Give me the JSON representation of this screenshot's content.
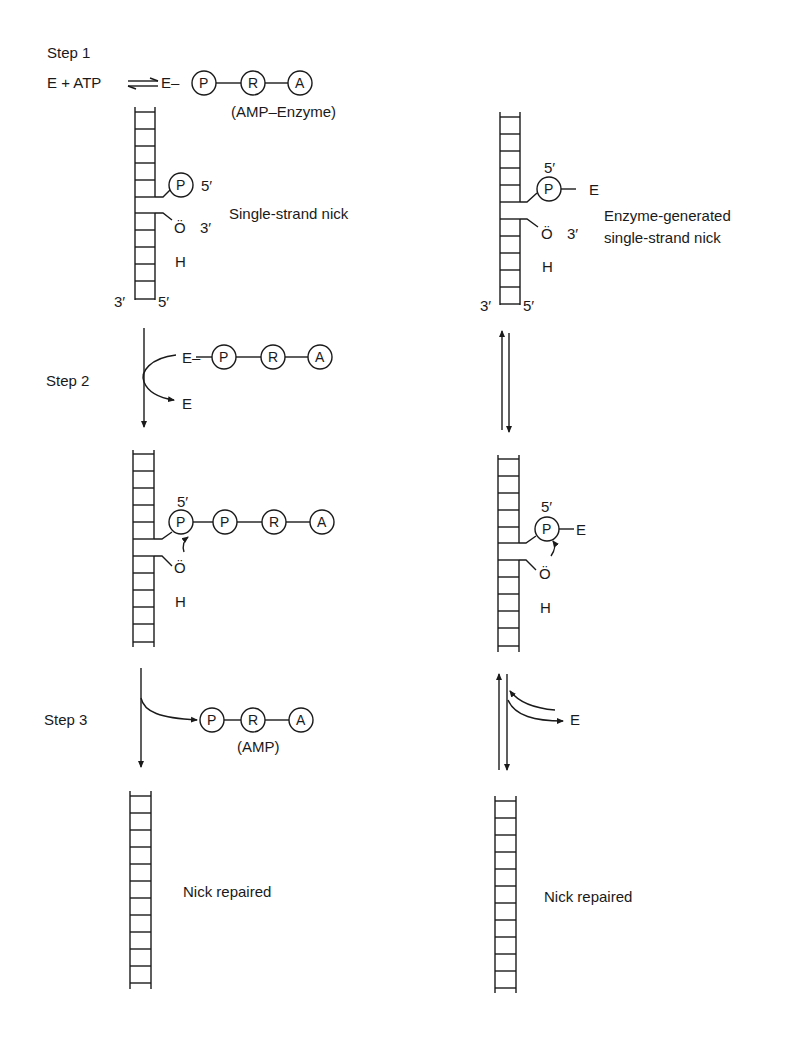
{
  "figure": {
    "colors": {
      "ink": "#1a1a1a",
      "background": "#ffffff"
    }
  },
  "left_pathway": {
    "step1": {
      "label": "Step 1",
      "equation_left": "E + ATP",
      "equation_right": "E–",
      "equilibrium_symbol": "⇌",
      "chain": [
        "P",
        "R",
        "A"
      ],
      "chain_caption": "(AMP–Enzyme)",
      "dna": {
        "nick_label": "Single-strand nick",
        "phosphate": "P",
        "five_prime": "5′",
        "oxygen": "Ö",
        "three_prime": "3′",
        "hydrogen": "H",
        "bottom_left": "3′",
        "bottom_right": "5′"
      }
    },
    "step2": {
      "label": "Step 2",
      "enzyme_in": "E–",
      "chain": [
        "P",
        "R",
        "A"
      ],
      "enzyme_out": "E",
      "dna": {
        "five_prime": "5′",
        "chain": [
          "P",
          "P",
          "R",
          "A"
        ],
        "oxygen": "Ö",
        "hydrogen": "H"
      }
    },
    "step3": {
      "label": "Step 3",
      "released_chain": [
        "P",
        "R",
        "A"
      ],
      "released_caption": "(AMP)",
      "result": "Nick repaired"
    }
  },
  "right_pathway": {
    "step1": {
      "dna": {
        "five_prime": "5′",
        "phosphate": "P",
        "enzyme": "E",
        "oxygen": "Ö",
        "three_prime": "3′",
        "hydrogen": "H",
        "nick_label_line1": "Enzyme-generated",
        "nick_label_line2": "single-strand nick",
        "bottom_left": "3′",
        "bottom_right": "5′"
      }
    },
    "step2": {
      "dna": {
        "five_prime": "5′",
        "phosphate": "P",
        "enzyme": "E",
        "oxygen": "Ö",
        "hydrogen": "H"
      }
    },
    "step3": {
      "enzyme": "E",
      "result": "Nick repaired"
    }
  }
}
